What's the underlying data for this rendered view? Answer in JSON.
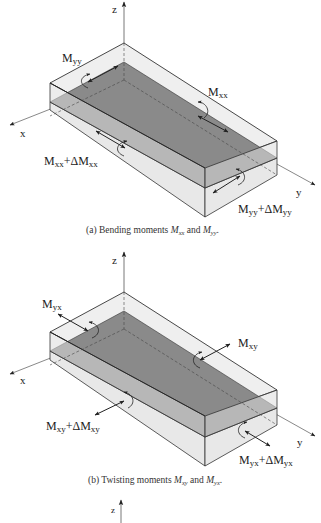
{
  "figures": [
    {
      "id": "a",
      "axes": {
        "z": "z",
        "x": "x",
        "y": "y"
      },
      "labels": {
        "top_left": "M",
        "top_left_sub": "yy",
        "top_right": "M",
        "top_right_sub": "xx",
        "bottom_left": "M",
        "bottom_left_sub": "xx",
        "bottom_left_delta": "+ΔM",
        "bottom_left_delta_sub": "xx",
        "bottom_right": "M",
        "bottom_right_sub": "yy",
        "bottom_right_delta": "+ΔM",
        "bottom_right_delta_sub": "yy"
      },
      "caption": {
        "prefix": "(a)  Bending moments ",
        "m1": "M",
        "m1_sub": "xx",
        "mid": " and ",
        "m2": "M",
        "m2_sub": "yy",
        "suffix": "."
      }
    },
    {
      "id": "b",
      "axes": {
        "z": "z",
        "x": "x",
        "y": "y"
      },
      "labels": {
        "top_left": "M",
        "top_left_sub": "yx",
        "top_right": "M",
        "top_right_sub": "xy",
        "bottom_left": "M",
        "bottom_left_sub": "xy",
        "bottom_left_delta": "+ΔM",
        "bottom_left_delta_sub": "xy",
        "bottom_right": "M",
        "bottom_right_sub": "yx",
        "bottom_right_delta": "+ΔM",
        "bottom_right_delta_sub": "yx"
      },
      "caption": {
        "prefix": "(b)  Twisting moments ",
        "m1": "M",
        "m1_sub": "xy",
        "mid": " and ",
        "m2": "M",
        "m2_sub": "yx",
        "suffix": "."
      }
    },
    {
      "id": "c-partial",
      "axes": {
        "z": "z"
      }
    }
  ],
  "colors": {
    "plate_light": "#eeeeee",
    "plate_mid": "#888888",
    "edge": "#333333"
  }
}
